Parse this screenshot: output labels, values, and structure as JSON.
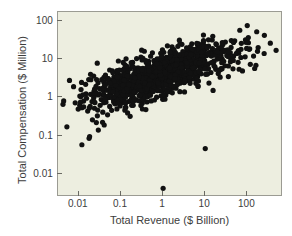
{
  "figure": {
    "background_color": "#ffffff",
    "panel_color": "#edeee0",
    "panel_border_color": "#9b9b93",
    "point_color": "#111111"
  },
  "chart_data": {
    "type": "scatter",
    "title": "",
    "xlabel": "Total Revenue ($ Billion)",
    "ylabel": "Total Compensation ($ Million)",
    "xscale": "log",
    "yscale": "log",
    "xlim": [
      0.0032,
      700
    ],
    "ylim": [
      0.0025,
      170
    ],
    "xticks": [
      0.01,
      0.1,
      1,
      10,
      100
    ],
    "xtick_labels": [
      "0.01",
      "0.1",
      "1",
      "10",
      "100"
    ],
    "yticks": [
      0.01,
      0.1,
      1,
      10,
      100
    ],
    "ytick_labels": [
      "0.01",
      "0.1",
      "1",
      "10",
      "100"
    ],
    "grid": false,
    "legend": false,
    "marker": "circle",
    "marker_size": 2.6,
    "n_points": 1100,
    "points": [
      [
        0.0042,
        0.66
      ],
      [
        0.0052,
        0.17
      ],
      [
        0.0075,
        1.9
      ],
      [
        0.0082,
        0.72
      ],
      [
        0.0105,
        0.62
      ],
      [
        0.0112,
        1.05
      ],
      [
        0.0118,
        0.058
      ],
      [
        0.013,
        0.8
      ],
      [
        0.0145,
        2.2
      ],
      [
        0.0152,
        0.95
      ],
      [
        0.0162,
        0.44
      ],
      [
        0.0175,
        0.085
      ],
      [
        0.018,
        0.095
      ],
      [
        0.019,
        1.2
      ],
      [
        0.0205,
        0.78
      ],
      [
        0.021,
        0.26
      ],
      [
        0.0225,
        3.6
      ],
      [
        0.0235,
        0.52
      ],
      [
        0.025,
        1.35
      ],
      [
        0.026,
        0.22
      ],
      [
        0.0275,
        0.33
      ],
      [
        0.0285,
        2.4
      ],
      [
        0.029,
        0.14
      ],
      [
        0.031,
        1.7
      ],
      [
        0.032,
        0.62
      ],
      [
        0.034,
        0.88
      ],
      [
        0.035,
        2.9
      ],
      [
        0.037,
        0.41
      ],
      [
        0.038,
        1.15
      ],
      [
        0.04,
        0.19
      ],
      [
        0.042,
        2.05
      ],
      [
        0.044,
        0.75
      ],
      [
        0.046,
        1.55
      ],
      [
        0.048,
        0.35
      ],
      [
        0.05,
        3.1
      ],
      [
        0.052,
        1.0
      ],
      [
        0.054,
        0.58
      ],
      [
        0.056,
        2.6
      ],
      [
        0.058,
        1.3
      ],
      [
        0.06,
        0.46
      ],
      [
        0.062,
        1.85
      ],
      [
        0.065,
        0.92
      ],
      [
        0.068,
        3.4
      ],
      [
        0.07,
        1.45
      ],
      [
        0.072,
        0.68
      ],
      [
        0.075,
        2.2
      ],
      [
        0.078,
        1.1
      ],
      [
        0.08,
        0.5
      ],
      [
        0.082,
        4.2
      ],
      [
        0.085,
        1.65
      ],
      [
        0.088,
        0.82
      ],
      [
        0.09,
        2.8
      ],
      [
        0.092,
        1.25
      ],
      [
        0.095,
        0.6
      ],
      [
        0.098,
        3.7
      ],
      [
        0.1,
        1.5
      ],
      [
        0.105,
        0.72
      ],
      [
        0.108,
        2.35
      ],
      [
        0.11,
        1.05
      ],
      [
        0.115,
        5.2
      ],
      [
        0.118,
        0.88
      ],
      [
        0.12,
        3.0
      ],
      [
        0.125,
        1.4
      ],
      [
        0.13,
        0.55
      ],
      [
        0.135,
        2.5
      ],
      [
        0.14,
        1.2
      ],
      [
        0.145,
        4.5
      ],
      [
        0.15,
        0.78
      ],
      [
        0.155,
        2.05
      ],
      [
        0.16,
        1.6
      ],
      [
        0.165,
        0.32
      ],
      [
        0.17,
        3.3
      ],
      [
        0.175,
        1.35
      ],
      [
        0.18,
        0.95
      ],
      [
        0.185,
        2.7
      ],
      [
        0.19,
        1.75
      ],
      [
        0.195,
        0.62
      ],
      [
        0.2,
        4.0
      ],
      [
        0.21,
        1.45
      ],
      [
        0.22,
        2.3
      ],
      [
        0.23,
        0.85
      ],
      [
        0.24,
        3.5
      ],
      [
        0.25,
        1.55
      ],
      [
        0.26,
        2.9
      ],
      [
        0.27,
        1.1
      ],
      [
        0.28,
        5.0
      ],
      [
        0.29,
        2.0
      ],
      [
        0.3,
        1.3
      ],
      [
        0.31,
        3.8
      ],
      [
        0.32,
        0.7
      ],
      [
        0.33,
        2.45
      ],
      [
        0.34,
        1.65
      ],
      [
        0.35,
        4.4
      ],
      [
        0.36,
        1.05
      ],
      [
        0.37,
        3.1
      ],
      [
        0.38,
        2.2
      ],
      [
        0.39,
        0.48
      ],
      [
        0.4,
        5.6
      ],
      [
        0.42,
        1.9
      ],
      [
        0.44,
        3.4
      ],
      [
        0.46,
        2.6
      ],
      [
        0.48,
        1.25
      ],
      [
        0.5,
        4.8
      ],
      [
        0.52,
        2.1
      ],
      [
        0.54,
        6.2
      ],
      [
        0.56,
        3.0
      ],
      [
        0.58,
        1.5
      ],
      [
        0.6,
        4.2
      ],
      [
        0.62,
        2.4
      ],
      [
        0.65,
        7.0
      ],
      [
        0.68,
        3.6
      ],
      [
        0.7,
        1.8
      ],
      [
        0.72,
        5.1
      ],
      [
        0.75,
        2.8
      ],
      [
        0.78,
        8.0
      ],
      [
        0.8,
        4.0
      ],
      [
        0.82,
        2.2
      ],
      [
        0.85,
        6.0
      ],
      [
        0.88,
        3.2
      ],
      [
        0.9,
        9.0
      ],
      [
        0.95,
        4.6
      ],
      [
        1.0,
        2.5
      ],
      [
        1.0,
        0.0042
      ],
      [
        1.05,
        7.2
      ],
      [
        1.1,
        3.8
      ],
      [
        1.15,
        5.5
      ],
      [
        1.2,
        2.9
      ],
      [
        1.25,
        10.0
      ],
      [
        1.3,
        4.4
      ],
      [
        1.35,
        6.8
      ],
      [
        1.4,
        3.4
      ],
      [
        1.5,
        8.5
      ],
      [
        1.6,
        5.0
      ],
      [
        1.7,
        3.0
      ],
      [
        1.8,
        11.0
      ],
      [
        1.9,
        6.4
      ],
      [
        2.0,
        4.0
      ],
      [
        2.2,
        9.5
      ],
      [
        2.4,
        5.8
      ],
      [
        2.6,
        3.6
      ],
      [
        2.8,
        12.0
      ],
      [
        3.0,
        7.0
      ],
      [
        3.2,
        4.5
      ],
      [
        3.5,
        14.0
      ],
      [
        3.8,
        8.2
      ],
      [
        4.0,
        5.2
      ],
      [
        4.5,
        16.0
      ],
      [
        5.0,
        9.0
      ],
      [
        5.5,
        6.0
      ],
      [
        6.0,
        18.0
      ],
      [
        6.5,
        10.0
      ],
      [
        7.0,
        6.8
      ],
      [
        8.0,
        20.0
      ],
      [
        9.0,
        11.0
      ],
      [
        10.0,
        7.5
      ],
      [
        10.0,
        0.046
      ],
      [
        12.0,
        22.0
      ],
      [
        14.0,
        12.0
      ],
      [
        16.0,
        8.5
      ],
      [
        18.0,
        25.0
      ],
      [
        20.0,
        13.0
      ],
      [
        25.0,
        9.5
      ],
      [
        30.0,
        28.0
      ],
      [
        35.0,
        15.0
      ],
      [
        40.0,
        10.5
      ],
      [
        50.0,
        30.0
      ],
      [
        60.0,
        16.0
      ],
      [
        70.0,
        11.0
      ],
      [
        90.0,
        32.0
      ],
      [
        110.0,
        18.0
      ],
      [
        140.0,
        12.0
      ],
      [
        180.0,
        20.0
      ],
      [
        250.0,
        14.0
      ],
      [
        350.0,
        26.0
      ],
      [
        480.0,
        17.0
      ]
    ]
  }
}
